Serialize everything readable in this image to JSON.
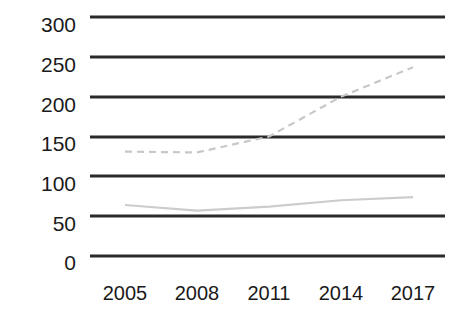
{
  "chart_data": {
    "type": "line",
    "title": "",
    "subtitle": "",
    "xlabel": "",
    "ylabel": "",
    "categories": [
      "2005",
      "2008",
      "2011",
      "2014",
      "2017"
    ],
    "x": [
      2005,
      2008,
      2011,
      2014,
      2017
    ],
    "series": [
      {
        "name": "series-dashed",
        "style": "dashed",
        "color": "#c8c8c8",
        "values": [
          131,
          130,
          150,
          200,
          237
        ]
      },
      {
        "name": "series-solid",
        "style": "solid",
        "color": "#cccccc",
        "values": [
          64,
          57,
          62,
          70,
          74
        ]
      }
    ],
    "ylim": [
      0,
      300
    ],
    "yticks": [
      0,
      50,
      100,
      150,
      200,
      250,
      300
    ],
    "ytick_labels": [
      "0",
      "50",
      "100",
      "150",
      "200",
      "250",
      "300"
    ],
    "xtick_labels": [
      "2005",
      "2008",
      "2011",
      "2014",
      "2017"
    ],
    "grid": true,
    "grid_color": "#2b2b2b",
    "legend": "none",
    "legend_position": "none",
    "annotations": []
  },
  "axis": {
    "y_labels": [
      {
        "text": "300",
        "value": 300
      },
      {
        "text": "250",
        "value": 250
      },
      {
        "text": "200",
        "value": 200
      },
      {
        "text": "150",
        "value": 150
      },
      {
        "text": "100",
        "value": 100
      },
      {
        "text": "50",
        "value": 50
      },
      {
        "text": "0",
        "value": 0
      }
    ],
    "x_labels": [
      {
        "text": "2005"
      },
      {
        "text": "2008"
      },
      {
        "text": "2011"
      },
      {
        "text": "2014"
      },
      {
        "text": "2017"
      }
    ]
  }
}
